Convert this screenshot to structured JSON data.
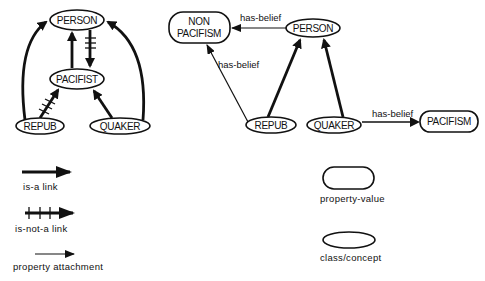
{
  "left_diagram": {
    "nodes": {
      "person": "PERSON",
      "pacifist": "PACIFIST",
      "repub": "REPUB",
      "quaker": "QUAKER"
    },
    "edges": [
      {
        "from": "PACIFIST",
        "to": "PERSON",
        "type": "is-a"
      },
      {
        "from": "PERSON",
        "to": "PACIFIST",
        "type": "is-not-a"
      },
      {
        "from": "REPUB",
        "to": "PACIFIST",
        "type": "is-not-a"
      },
      {
        "from": "QUAKER",
        "to": "PACIFIST",
        "type": "is-a"
      },
      {
        "from": "REPUB",
        "to": "PERSON",
        "type": "is-a"
      },
      {
        "from": "QUAKER",
        "to": "PERSON",
        "type": "is-a"
      }
    ]
  },
  "right_diagram": {
    "nodes": {
      "non_pacifism_line1": "NON",
      "non_pacifism_line2": "PACIFISM",
      "person": "PERSON",
      "repub": "REPUB",
      "quaker": "QUAKER",
      "pacifism": "PACIFISM"
    },
    "edge_labels": {
      "person_to_nonpacifism": "has-belief",
      "repub_to_nonpacifism": "has-belief",
      "quaker_to_pacifism": "has-belief"
    },
    "edges": [
      {
        "from": "PERSON",
        "to": "NON PACIFISM",
        "type": "property",
        "label": "has-belief"
      },
      {
        "from": "REPUB",
        "to": "NON PACIFISM",
        "type": "property",
        "label": "has-belief"
      },
      {
        "from": "REPUB",
        "to": "PERSON",
        "type": "is-a"
      },
      {
        "from": "QUAKER",
        "to": "PERSON",
        "type": "is-a"
      },
      {
        "from": "QUAKER",
        "to": "PACIFISM",
        "type": "property",
        "label": "has-belief"
      }
    ]
  },
  "legend": {
    "isa_link": "is-a  link",
    "isnota_link": "is-not-a   link",
    "property_attachment": "property  attachment",
    "property_value": "property-value",
    "class_concept": "class/concept"
  }
}
